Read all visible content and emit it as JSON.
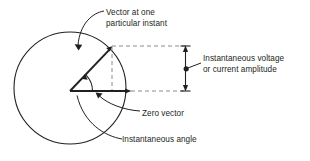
{
  "diagram": {
    "title_none": "",
    "stroke_color": "#231f20",
    "dash_color": "#8a8a8a",
    "background": "#ffffff",
    "circle": {
      "cx": 70,
      "cy": 88,
      "r": 56
    },
    "origin": {
      "x": 70,
      "y": 91
    },
    "vector_tip": {
      "x": 112,
      "y": 46
    },
    "zero_vector_end": {
      "x": 131,
      "y": 91
    },
    "measure_x": 185,
    "labels": {
      "vector_instant": {
        "line1": "Vector at one",
        "line2": "particular instant"
      },
      "amplitude": {
        "line1": "Instantaneous voltage",
        "line2": "or current amplitude"
      },
      "zero_vector": "Zero vector",
      "instantaneous_angle": "Instantaneous angle"
    }
  }
}
